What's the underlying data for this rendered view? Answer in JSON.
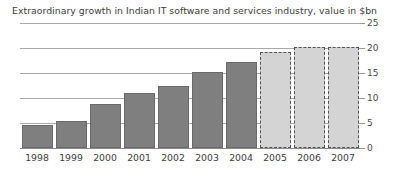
{
  "chart_data": {
    "type": "bar",
    "title": "Extraordinary growth in Indian IT software and services industry, value in $bn",
    "xlabel": "",
    "ylabel": "",
    "ylim": [
      0,
      25
    ],
    "yticks": [
      0,
      5,
      10,
      15,
      20,
      25
    ],
    "ytick_labels": [
      "0",
      "5",
      "10",
      "15",
      "20",
      "25"
    ],
    "grid": "horizontal",
    "legend": "none",
    "categories": [
      "1998",
      "1999",
      "2000",
      "2001",
      "2002",
      "2003",
      "2004",
      "2005",
      "2006",
      "2007"
    ],
    "values": [
      4.6,
      5.4,
      8.8,
      11.0,
      12.5,
      15.2,
      17.2,
      19.2,
      20.2,
      20.2
    ],
    "bar_styles": [
      "actual",
      "actual",
      "actual",
      "actual",
      "actual",
      "actual",
      "actual",
      "forecast",
      "forecast",
      "forecast"
    ],
    "colors": {
      "actual_fill": "#7f7f7f",
      "actual_border": "#6a6a6a",
      "forecast_fill": "#d4d4d4",
      "forecast_border": "#555555",
      "gridline": "#a9a9a9",
      "axis": "#8c8c8c",
      "text": "#3d3d3d",
      "background": "#ffffff"
    }
  }
}
